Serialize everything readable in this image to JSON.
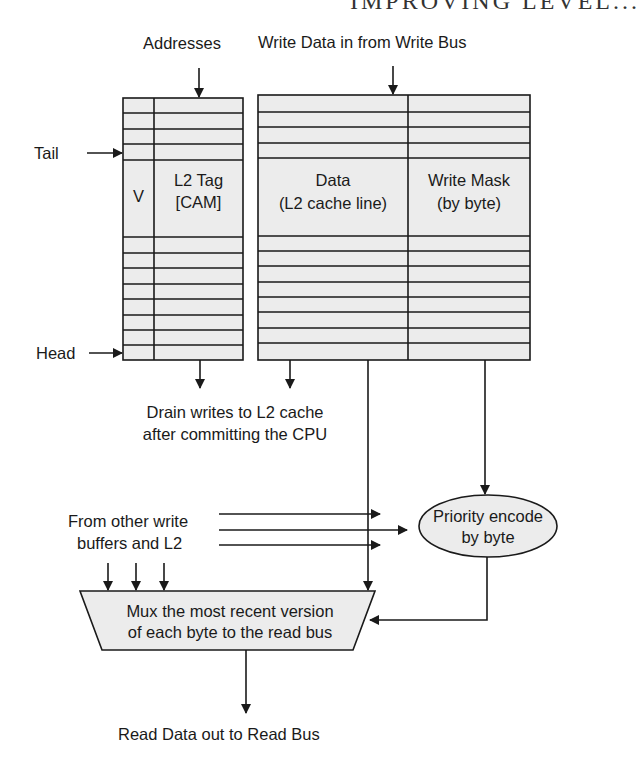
{
  "header": {
    "cut_off_heading": "IMPROVING LEVEL..."
  },
  "labels": {
    "addresses": "Addresses",
    "write_data_in": "Write Data in from Write Bus",
    "tail": "Tail",
    "head": "Head",
    "v_column": "V",
    "tag_line1": "L2 Tag",
    "tag_line2": "[CAM]",
    "data_line1": "Data",
    "data_line2": "(L2 cache line)",
    "mask_line1": "Write Mask",
    "mask_line2": "(by byte)",
    "drain_line1": "Drain writes to L2 cache",
    "drain_line2": "after committing the CPU",
    "other_line1": "From other write",
    "other_line2": "buffers and L2",
    "priority_line1": "Priority encode",
    "priority_line2": "by byte",
    "mux_line1": "Mux the most recent version",
    "mux_line2": "of each byte to the read bus",
    "read_out": "Read Data out to Read Bus"
  },
  "colors": {
    "fill": "#ececec",
    "stroke": "#1a1a1a",
    "background": "#ffffff"
  }
}
